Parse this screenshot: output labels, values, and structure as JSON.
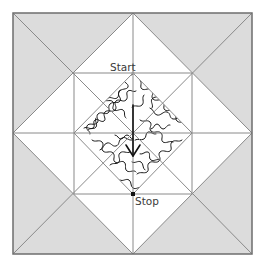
{
  "diagram": {
    "type": "quilt-block",
    "colors": {
      "background": "#ffffff",
      "corner_fill": "#dcdcdc",
      "seam_line": "#8a8a8a",
      "border": "#6e6e6e",
      "quilting_line": "#1a1a1a",
      "arrow": "#111111",
      "label": "#3a3a3a"
    },
    "labels": {
      "start": "Start",
      "stop": "Stop"
    },
    "geometry": {
      "outer_square": {
        "x1": 13,
        "y1": 13,
        "x2": 252,
        "y2": 254
      },
      "center": {
        "x": 133,
        "y": 133
      },
      "inner_square": {
        "x1": 74,
        "y1": 73,
        "x2": 192,
        "y2": 194
      },
      "inner_diamond": [
        [
          133,
          73
        ],
        [
          192,
          133
        ],
        [
          133,
          194
        ],
        [
          74,
          133
        ]
      ],
      "start_point": [
        133,
        73
      ],
      "stop_point": [
        133,
        194
      ],
      "arrow": {
        "from": [
          133,
          105
        ],
        "to": [
          133,
          156
        ]
      }
    },
    "regions": [
      {
        "name": "corner-triangle-top-left",
        "fill": "gray"
      },
      {
        "name": "corner-triangle-top-right",
        "fill": "gray"
      },
      {
        "name": "corner-triangle-bottom-left",
        "fill": "gray"
      },
      {
        "name": "corner-triangle-bottom-right",
        "fill": "gray"
      },
      {
        "name": "center-diamond",
        "fill": "meander-quilting"
      }
    ],
    "quilting_pattern": "stipple-meander"
  }
}
